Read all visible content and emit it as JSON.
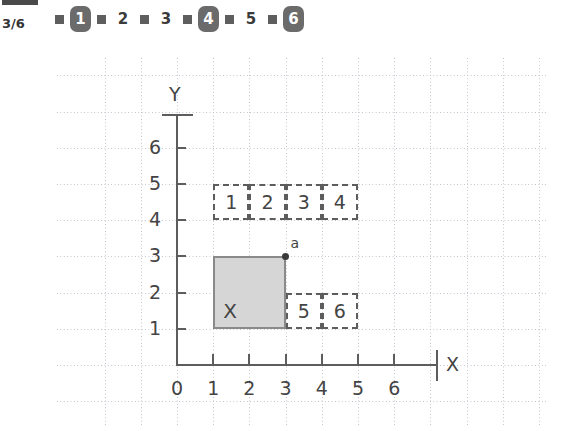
{
  "header": {
    "page_counter": "3/6",
    "pager": [
      {
        "type": "bullet",
        "icon": "square-bullet-icon"
      },
      {
        "type": "number",
        "label": "1",
        "selected": true
      },
      {
        "type": "bullet",
        "icon": "square-bullet-icon"
      },
      {
        "type": "number",
        "label": "2",
        "selected": false
      },
      {
        "type": "bullet",
        "icon": "square-bullet-icon"
      },
      {
        "type": "number",
        "label": "3",
        "selected": false
      },
      {
        "type": "bullet",
        "icon": "square-bullet-icon"
      },
      {
        "type": "number",
        "label": "4",
        "selected": true
      },
      {
        "type": "bullet",
        "icon": "square-bullet-icon"
      },
      {
        "type": "number",
        "label": "5",
        "selected": false
      },
      {
        "type": "bullet",
        "icon": "square-bullet-icon"
      },
      {
        "type": "number",
        "label": "6",
        "selected": true
      }
    ]
  },
  "colors": {
    "axis": "#5d5d5d",
    "grid": "#bcbcc8",
    "fill": "#d6d6d6",
    "fill_border": "#8a8a8a",
    "badge": "#6b6b6b",
    "text": "#444444"
  },
  "chart_data": {
    "type": "table",
    "title": "",
    "xlabel": "X",
    "ylabel": "Y",
    "xlim": [
      0,
      7
    ],
    "ylim": [
      0,
      7
    ],
    "xticks": [
      "0",
      "1",
      "2",
      "3",
      "4",
      "5",
      "6"
    ],
    "yticks": [
      "1",
      "2",
      "3",
      "4",
      "5",
      "6"
    ],
    "grid": true,
    "legend": "none",
    "filled_region": {
      "label": "X",
      "x0": 1,
      "y0": 1,
      "x1": 3,
      "y1": 3,
      "area": 4
    },
    "marked_point": {
      "label": "a",
      "x": 3,
      "y": 3
    },
    "dashed_cells": [
      {
        "label": "1",
        "x0": 1,
        "y0": 4,
        "x1": 2,
        "y1": 5
      },
      {
        "label": "2",
        "x0": 2,
        "y0": 4,
        "x1": 3,
        "y1": 5
      },
      {
        "label": "3",
        "x0": 3,
        "y0": 4,
        "x1": 4,
        "y1": 5
      },
      {
        "label": "4",
        "x0": 4,
        "y0": 4,
        "x1": 5,
        "y1": 5
      },
      {
        "label": "5",
        "x0": 3,
        "y0": 1,
        "x1": 4,
        "y1": 2
      },
      {
        "label": "6",
        "x0": 4,
        "y0": 1,
        "x1": 5,
        "y1": 2
      }
    ]
  }
}
